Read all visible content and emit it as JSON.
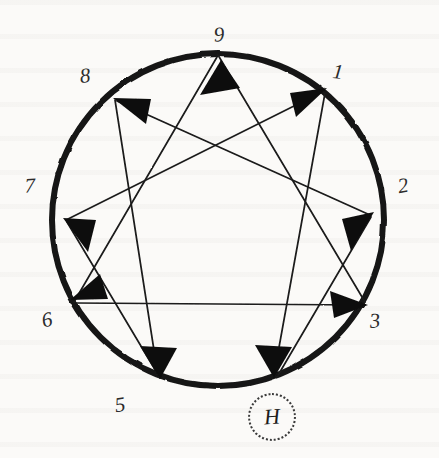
{
  "diagram": {
    "ink_color": "#1a1a1a",
    "paper_color": "#fbfaf8",
    "circle": {
      "cx": 218,
      "cy": 220,
      "r": 166,
      "stroke_width": 6
    },
    "points": [
      {
        "id": "1",
        "label": "1",
        "angle_deg": -50,
        "label_x": 338,
        "label_y": 72
      },
      {
        "id": "2",
        "label": "2",
        "angle_deg": -10,
        "label_x": 403,
        "label_y": 186
      },
      {
        "id": "3",
        "label": "3",
        "angle_deg": 30,
        "label_x": 375,
        "label_y": 321
      },
      {
        "id": "4",
        "label": "",
        "angle_deg": 70,
        "label_x": 272,
        "label_y": 412
      },
      {
        "id": "5",
        "label": "5",
        "angle_deg": 110,
        "label_x": 120,
        "label_y": 405
      },
      {
        "id": "6",
        "label": "6",
        "angle_deg": 150,
        "label_x": 47,
        "label_y": 320
      },
      {
        "id": "7",
        "label": "7",
        "angle_deg": 190,
        "label_x": 30,
        "label_y": 186
      },
      {
        "id": "8",
        "label": "8",
        "angle_deg": 230,
        "label_x": 85,
        "label_y": 76
      },
      {
        "id": "9",
        "label": "9",
        "angle_deg": 270,
        "label_x": 219,
        "label_y": 35
      }
    ],
    "triangle_sequence": [
      "9",
      "3",
      "6",
      "9"
    ],
    "hexad_sequence": [
      "1",
      "4",
      "2",
      "8",
      "5",
      "7",
      "1"
    ],
    "arrows": [
      {
        "from": "9",
        "to": "3",
        "head_at": "3"
      },
      {
        "from": "3",
        "to": "6",
        "head_at": "6"
      },
      {
        "from": "6",
        "to": "9",
        "head_at": "9"
      },
      {
        "from": "1",
        "to": "4",
        "head_at": "4"
      },
      {
        "from": "4",
        "to": "2",
        "head_at": "2"
      },
      {
        "from": "2",
        "to": "8",
        "head_at": "8"
      },
      {
        "from": "8",
        "to": "5",
        "head_at": "5"
      },
      {
        "from": "5",
        "to": "7",
        "head_at": "7"
      },
      {
        "from": "7",
        "to": "1",
        "head_at": "1"
      }
    ],
    "marker": {
      "glyph": "H",
      "name": "h-marker",
      "x": 272,
      "y": 417,
      "radius": 22,
      "border_style": "dotted"
    }
  }
}
